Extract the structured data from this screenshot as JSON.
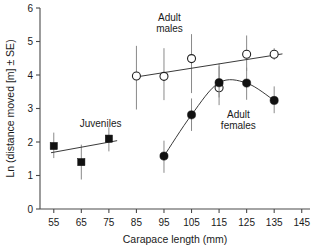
{
  "chart_data": {
    "type": "scatter",
    "title": "",
    "xlabel": "Carapace length (mm)",
    "ylabel": "Ln (distance moved [m] ± SE)",
    "xlim": [
      50,
      148
    ],
    "ylim": [
      0,
      6
    ],
    "xticks": [
      55,
      65,
      75,
      85,
      95,
      105,
      115,
      125,
      135,
      145
    ],
    "yticks": [
      0,
      1,
      2,
      3,
      4,
      5,
      6
    ],
    "grid": false,
    "legend": "none",
    "annotations": [
      {
        "text_line1": "Juveniles",
        "text_line2": "",
        "x": 72,
        "y": 2.45
      },
      {
        "text_line1": "Adult",
        "text_line2": "males",
        "x": 97,
        "y": 5.62
      },
      {
        "text_line1": "Adult",
        "text_line2": "females",
        "x": 122,
        "y": 2.72
      }
    ],
    "series": [
      {
        "name": "Juveniles",
        "marker": "filled-square",
        "fit": "linear",
        "x": [
          55,
          65,
          75
        ],
        "values": [
          1.88,
          1.4,
          2.1
        ],
        "err_low": [
          1.52,
          0.88,
          1.72
        ],
        "err_high": [
          2.28,
          1.92,
          2.44
        ],
        "fit_x": [
          54,
          78
        ],
        "fit_y": [
          1.68,
          2.04
        ]
      },
      {
        "name": "Adult males",
        "marker": "open-circle",
        "fit": "linear",
        "x": [
          85,
          95,
          105,
          115,
          125,
          135
        ],
        "values": [
          3.97,
          3.96,
          4.49,
          3.62,
          4.62,
          4.62
        ],
        "err_low": [
          2.97,
          3.25,
          3.46,
          3.1,
          4.12,
          4.45
        ],
        "err_high": [
          4.87,
          4.8,
          5.22,
          4.34,
          5.18,
          4.8
        ],
        "fit_x": [
          84,
          138
        ],
        "fit_y": [
          3.93,
          4.63
        ]
      },
      {
        "name": "Adult females",
        "marker": "filled-circle",
        "fit": "curve",
        "x": [
          95,
          105,
          115,
          125,
          135
        ],
        "values": [
          1.58,
          2.81,
          3.77,
          3.76,
          3.24
        ],
        "err_low": [
          1.08,
          2.33,
          3.33,
          3.26,
          2.86
        ],
        "err_high": [
          2.04,
          3.3,
          4.26,
          4.22,
          3.66
        ]
      }
    ]
  }
}
